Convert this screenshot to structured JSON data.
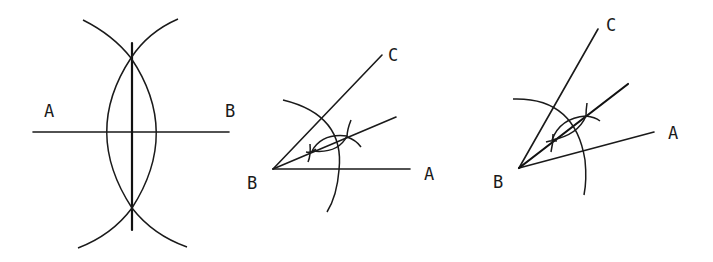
{
  "figures": [
    {
      "id": "perpendicular-bisector",
      "description": "Perpendicular bisector of segment AB constructed with compass arcs",
      "labels": {
        "left": "A",
        "right": "B"
      },
      "segment": {
        "from": [
          33,
          132
        ],
        "to": [
          229,
          132
        ]
      },
      "bisector": {
        "from": [
          132,
          43
        ],
        "to": [
          132,
          230
        ]
      },
      "intersections": [
        [
          131,
          58
        ],
        [
          132,
          208
        ]
      ]
    },
    {
      "id": "angle-bisector-1",
      "description": "Bisector of angle ABC with horizontal ray BA",
      "labels": {
        "vertex": "B",
        "ray1": "A",
        "ray2": "C"
      },
      "vertex": [
        273,
        169
      ],
      "ray_a_end": [
        410,
        169
      ],
      "ray_c_end": [
        382,
        55
      ],
      "bisector_end": [
        396,
        117
      ]
    },
    {
      "id": "angle-bisector-2",
      "description": "Bisector of angle ABC with tilted ray BA",
      "labels": {
        "vertex": "B",
        "ray1": "A",
        "ray2": "C"
      },
      "vertex": [
        519,
        168
      ],
      "ray_a_end": [
        654,
        132
      ],
      "ray_c_end": [
        598,
        29
      ],
      "bisector_end": [
        628,
        84
      ]
    }
  ],
  "colors": {
    "stroke": "#1a1a1a",
    "background": "#ffffff"
  }
}
